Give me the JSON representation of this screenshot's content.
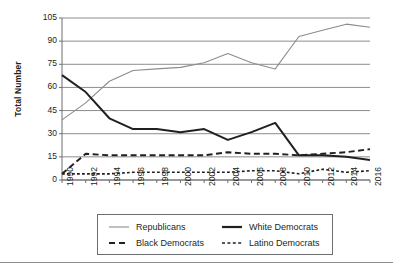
{
  "chart_data": {
    "type": "line",
    "title": "",
    "xlabel": "",
    "ylabel": "Total Number",
    "x": [
      1990,
      1992,
      1994,
      1996,
      1998,
      2000,
      2002,
      2004,
      2006,
      2008,
      2010,
      2012,
      2014,
      2016
    ],
    "xtick_labels": [
      "1990",
      "1992",
      "1994",
      "1996",
      "1998",
      "2000",
      "2002",
      "2004",
      "2006",
      "2008",
      "2010",
      "2012",
      "2014",
      "2016"
    ],
    "ytick_labels": [
      "0",
      "15",
      "30",
      "45",
      "60",
      "75",
      "90",
      "105"
    ],
    "yticks": [
      0,
      15,
      30,
      45,
      60,
      75,
      90,
      105
    ],
    "ylim": [
      0,
      105
    ],
    "xlim": [
      1990,
      2016
    ],
    "grid": "horizontal",
    "legend_position": "bottom",
    "series": [
      {
        "name": "Republicans",
        "style": "solid-thin-gray",
        "color": "#8c8c8c",
        "values": [
          39,
          50,
          64,
          71,
          72,
          73,
          76,
          82,
          76,
          72,
          93,
          97,
          101,
          99
        ]
      },
      {
        "name": "White Democrats",
        "style": "solid-thick-black",
        "color": "#231f20",
        "values": [
          68,
          57,
          40,
          33,
          33,
          31,
          33,
          26,
          31,
          37,
          16,
          16,
          15,
          13
        ]
      },
      {
        "name": "Black Democrats",
        "style": "dashed-black",
        "color": "#231f20",
        "values": [
          4,
          17,
          16,
          16,
          16,
          16,
          16,
          18,
          17,
          17,
          16,
          17,
          18,
          20
        ]
      },
      {
        "name": "Latino Democrats",
        "style": "dotted-black",
        "color": "#231f20",
        "values": [
          4,
          4,
          4,
          5,
          5,
          5,
          5,
          5,
          6,
          6,
          4,
          7,
          5,
          6
        ]
      }
    ]
  },
  "legend": {
    "entries": [
      {
        "label": "Republicans"
      },
      {
        "label": "White Democrats"
      },
      {
        "label": "Black Democrats"
      },
      {
        "label": "Latino Democrats"
      }
    ]
  }
}
